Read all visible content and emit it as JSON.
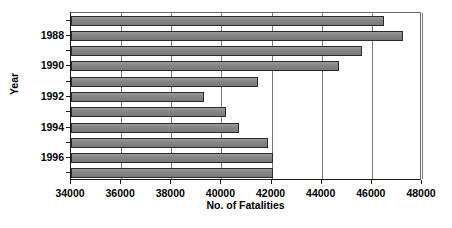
{
  "chart_data": {
    "type": "bar",
    "orientation": "horizontal",
    "title": "",
    "xlabel": "No. of Fatalities",
    "ylabel": "Year",
    "xlim": [
      34000,
      48000
    ],
    "xticks": [
      34000,
      36000,
      38000,
      40000,
      42000,
      44000,
      46000,
      48000
    ],
    "xtick_labels": [
      "34000",
      "36000",
      "38000",
      "40000",
      "42000",
      "44000",
      "46000",
      "48000"
    ],
    "ytick_labels": [
      "1988",
      "1990",
      "1992",
      "1994",
      "1996"
    ],
    "ytick_categories": [
      1988,
      1990,
      1992,
      1994,
      1996
    ],
    "grid": "vertical",
    "legend": "none",
    "bar_color": "#808080",
    "bar_edge_color": "#2b2b2b",
    "categories": [
      1987,
      1988,
      1989,
      1990,
      1991,
      1992,
      1993,
      1994,
      1995,
      1996,
      1997
    ],
    "values": [
      46480,
      47230,
      45600,
      44700,
      41450,
      39300,
      40200,
      40700,
      41850,
      42050,
      42050
    ],
    "points": [
      {
        "year": "1987",
        "value": 46480
      },
      {
        "year": "1988",
        "value": 47230
      },
      {
        "year": "1989",
        "value": 45600
      },
      {
        "year": "1990",
        "value": 44700
      },
      {
        "year": "1991",
        "value": 41450
      },
      {
        "year": "1992",
        "value": 39300
      },
      {
        "year": "1993",
        "value": 40200
      },
      {
        "year": "1994",
        "value": 40700
      },
      {
        "year": "1995",
        "value": 41850
      },
      {
        "year": "1996",
        "value": 42050
      },
      {
        "year": "1997",
        "value": 42050
      }
    ]
  }
}
